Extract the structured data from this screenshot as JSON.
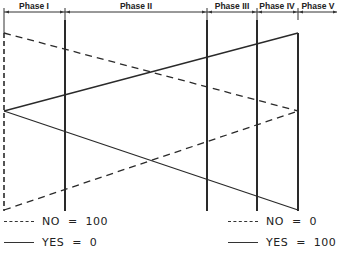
{
  "header": {
    "phases": [
      {
        "label": "Phase I",
        "x_start": 4,
        "x_end": 65
      },
      {
        "label": "Phase II",
        "x_start": 65,
        "x_end": 207
      },
      {
        "label": "Phase III",
        "x_start": 207,
        "x_end": 257
      },
      {
        "label": "Phase IV",
        "x_start": 257,
        "x_end": 298
      },
      {
        "label": "Phase V",
        "x_start": 298,
        "x_end": 337
      }
    ]
  },
  "lines": {
    "no_line_1": {
      "style": "dashed",
      "from": [
        4,
        33
      ],
      "to": [
        298,
        111
      ]
    },
    "no_line_2": {
      "style": "dashed",
      "from": [
        4,
        210
      ],
      "to": [
        298,
        111
      ]
    },
    "yes_line_1": {
      "style": "solid",
      "from": [
        4,
        111
      ],
      "to": [
        298,
        33
      ]
    },
    "yes_line_2": {
      "style": "solid",
      "from": [
        4,
        111
      ],
      "to": [
        298,
        210
      ]
    }
  },
  "legend_left": {
    "no_label": "NO  =  100",
    "yes_label": "YES  =  0"
  },
  "legend_right": {
    "no_label": "NO  =  0",
    "yes_label": "YES  =  100"
  },
  "colors": {
    "line": "#2a2a2a",
    "background": "#ffffff"
  }
}
